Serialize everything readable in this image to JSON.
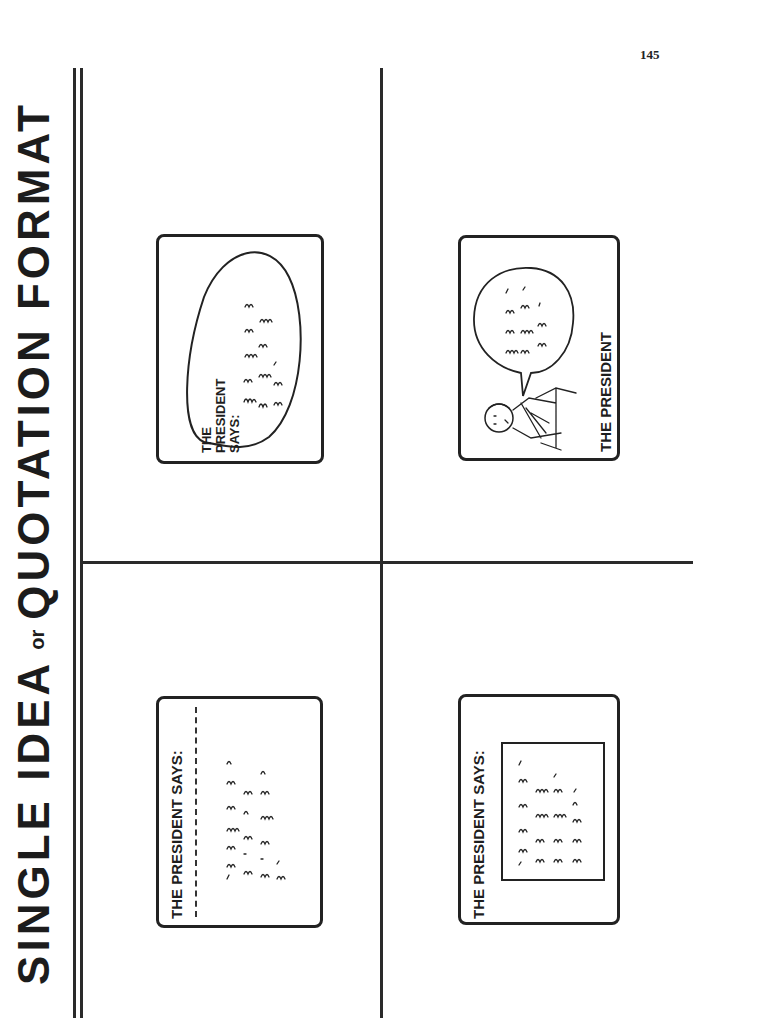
{
  "page": {
    "number": "145",
    "title": {
      "part1": "SINGLE IDEA",
      "connector": "or",
      "part2": "QUOTATION FORMAT"
    }
  },
  "cards": [
    {
      "position": "top-left",
      "style": "speech-bubble-ellipse",
      "label_lines": [
        "THE",
        "PRESIDENT",
        "SAYS:"
      ],
      "quote_placeholder": "handwritten scribble quotation"
    },
    {
      "position": "top-right",
      "style": "cartoon-figure-with-speech-balloon",
      "label": "THE PRESIDENT",
      "quote_placeholder": "handwritten scribble quotation"
    },
    {
      "position": "bottom-left",
      "style": "header-with-dashed-divider",
      "label": "THE PRESIDENT SAYS:",
      "quote_placeholder": "handwritten scribble quotation"
    },
    {
      "position": "bottom-right",
      "style": "header-with-inset-box",
      "label": "THE PRESIDENT SAYS:",
      "quote_placeholder": "handwritten scribble quotation"
    }
  ],
  "colors": {
    "ink": "#222222",
    "paper": "#ffffff"
  }
}
